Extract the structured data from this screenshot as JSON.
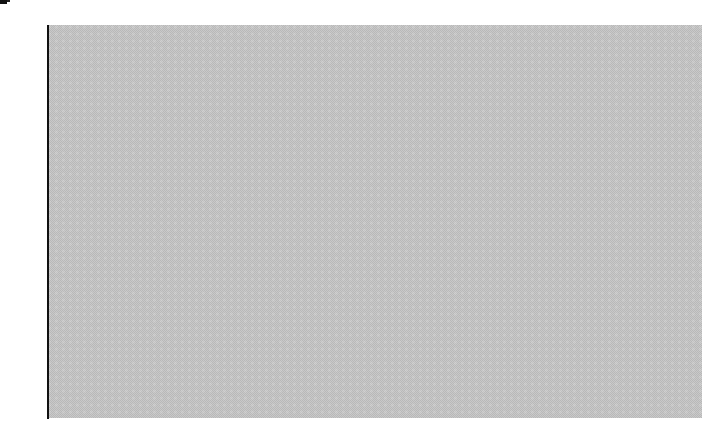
{
  "chart_data": {
    "type": "box",
    "title": "",
    "xlabel": "",
    "ylabel": "",
    "ylim": [
      0,
      16
    ],
    "yticks": [
      0,
      2,
      4,
      6,
      8,
      10,
      12,
      14,
      16
    ],
    "grid": false,
    "legend": null,
    "series": [
      {
        "name": "",
        "whisker_low": 2.1,
        "q1": 6.1,
        "median": 8.0,
        "q3": 10.8,
        "whisker_high": 14.3,
        "mean": 8.0
      }
    ]
  },
  "axis": {
    "labels": [
      "0",
      "2",
      "4",
      "6",
      "8",
      "10",
      "12",
      "14",
      "16"
    ]
  }
}
